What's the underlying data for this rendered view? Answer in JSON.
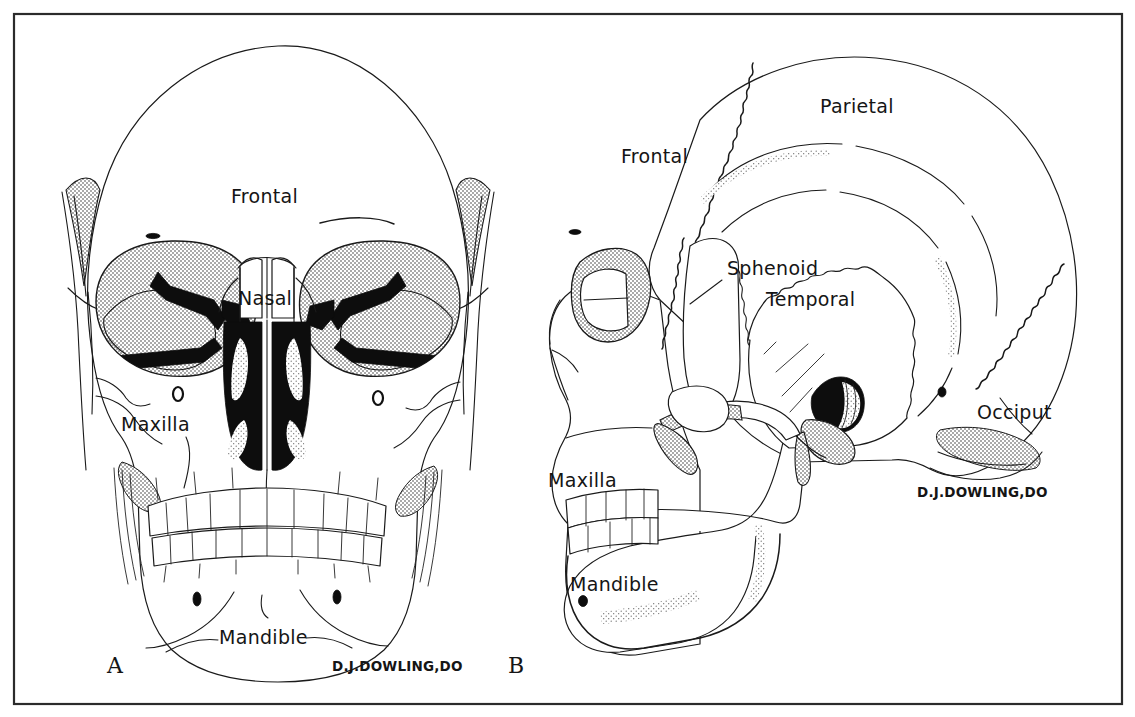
{
  "figure": {
    "artist_signature": "D.J.DOWLING,DO",
    "background_color": "#ffffff",
    "ink_color": "#1a1a1a",
    "frame_color": "#2b2b2b"
  },
  "panels": [
    {
      "id": "A",
      "letter": "A",
      "view": "anterior",
      "labels": [
        {
          "text": "Frontal",
          "x": 231,
          "y": 203
        },
        {
          "text": "Nasal",
          "x": 238,
          "y": 305
        },
        {
          "text": "Maxilla",
          "x": 121,
          "y": 431
        },
        {
          "text": "Mandible",
          "x": 219,
          "y": 644
        }
      ],
      "signature": {
        "text": "D.J.DOWLING,DO",
        "x": 332,
        "y": 671
      },
      "letter_pos": {
        "x": 107,
        "y": 673
      }
    },
    {
      "id": "B",
      "letter": "B",
      "view": "lateral",
      "labels": [
        {
          "text": "Parietal",
          "x": 820,
          "y": 113
        },
        {
          "text": "Frontal",
          "x": 621,
          "y": 163
        },
        {
          "text": "Sphenoid",
          "x": 727,
          "y": 275
        },
        {
          "text": "Temporal",
          "x": 766,
          "y": 306
        },
        {
          "text": "Occiput",
          "x": 977,
          "y": 419
        },
        {
          "text": "Maxilla",
          "x": 548,
          "y": 487
        },
        {
          "text": "Mandible",
          "x": 570,
          "y": 591
        }
      ],
      "signature": {
        "text": "D.J.DOWLING,DO",
        "x": 917,
        "y": 497
      },
      "letter_pos": {
        "x": 508,
        "y": 673
      }
    }
  ],
  "bone_names": [
    "Frontal",
    "Parietal",
    "Temporal",
    "Sphenoid",
    "Occiput",
    "Nasal",
    "Maxilla",
    "Mandible"
  ],
  "frame": {
    "x": 13,
    "y": 13,
    "width": 1110,
    "height": 692
  }
}
